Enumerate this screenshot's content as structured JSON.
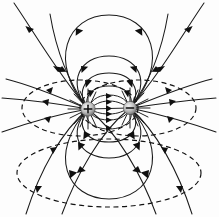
{
  "figure": {
    "type": "physics-field-diagram",
    "width": 219,
    "height": 217,
    "background_color": "#fdfdfd",
    "line_color": "#1a1a1a",
    "dash_color": "#111111"
  },
  "charges": [
    {
      "name": "positive-charge",
      "sign": "+",
      "polarity": "positive",
      "cx": 88,
      "cy": 109,
      "r": 7.2,
      "fill_center": "#f0f0f0",
      "fill_edge": "#7d7d7d"
    },
    {
      "name": "negative-charge",
      "sign": "−",
      "polarity": "negative",
      "cx": 130,
      "cy": 108,
      "r": 6.6,
      "fill_center": "#efefef",
      "fill_edge": "#808080"
    }
  ],
  "equipotentials": [
    {
      "name": "left-lobe-ellipse",
      "cx": 80,
      "cy": 108,
      "rx": 58,
      "ry": 28
    },
    {
      "name": "right-lobe-ellipse",
      "cx": 138,
      "cy": 108,
      "rx": 58,
      "ry": 28
    },
    {
      "name": "outer-bottom-ellipse",
      "cx": 109,
      "cy": 173,
      "rx": 92,
      "ry": 34
    }
  ],
  "field_loops": {
    "upper": [
      {
        "name": "upper-loop-1",
        "apex_y": 15,
        "half_width": 62
      },
      {
        "name": "upper-loop-2",
        "apex_y": 56,
        "half_width": 43
      },
      {
        "name": "upper-loop-3",
        "apex_y": 73,
        "half_width": 34
      },
      {
        "name": "upper-loop-4",
        "apex_y": 86,
        "half_width": 26
      },
      {
        "name": "upper-loop-5",
        "apex_y": 95,
        "half_width": 19
      },
      {
        "name": "upper-loop-6",
        "apex_y": 101,
        "half_width": 14
      }
    ],
    "lower": [
      {
        "name": "lower-loop-1",
        "apex_y": 199,
        "half_width": 62
      },
      {
        "name": "lower-loop-2",
        "apex_y": 158,
        "half_width": 43
      },
      {
        "name": "lower-loop-3",
        "apex_y": 142,
        "half_width": 34
      },
      {
        "name": "lower-loop-4",
        "apex_y": 129,
        "half_width": 26
      },
      {
        "name": "lower-loop-5",
        "apex_y": 120,
        "half_width": 19
      },
      {
        "name": "lower-loop-6",
        "apex_y": 114,
        "half_width": 14
      }
    ]
  },
  "escaping_lines": {
    "count": 12,
    "description": "Field lines leaving the positive charge outward past the frame edges and curving into the negative charge"
  },
  "arrow_direction": "from positive charge to negative charge",
  "labels": {
    "plus_sign": "+",
    "minus_sign": "−"
  }
}
